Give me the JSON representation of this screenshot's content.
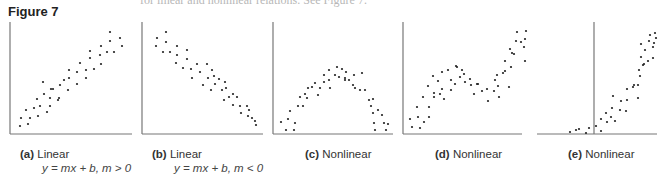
{
  "header": {
    "figure_label": "Figure 7",
    "cut_text": "for linear and nonlinear relations. See Figure 7."
  },
  "panels": [
    {
      "id": "a",
      "letter": "(a)",
      "title": "Linear",
      "equation": "y = mx + b, m > 0"
    },
    {
      "id": "b",
      "letter": "(b)",
      "title": "Linear",
      "equation": "y = mx + b, m < 0"
    },
    {
      "id": "c",
      "letter": "(c)",
      "title": "Nonlinear",
      "equation": ""
    },
    {
      "id": "d",
      "letter": "(d)",
      "title": "Nonlinear",
      "equation": ""
    },
    {
      "id": "e",
      "letter": "(e)",
      "title": "Nonlinear",
      "equation": ""
    }
  ],
  "colors": {
    "axis": "#777777",
    "point": "#222222",
    "text": "#333333"
  },
  "chart_data": [
    {
      "type": "scatter",
      "title": "(a) Linear  y = mx + b, m > 0",
      "xlabel": "",
      "ylabel": "",
      "axes_box": {
        "x0": 10,
        "x1": 132,
        "y_top": 22,
        "y_bottom": 134
      },
      "points": [
        [
          20,
          126
        ],
        [
          28,
          124
        ],
        [
          21,
          118
        ],
        [
          30,
          118
        ],
        [
          38,
          116
        ],
        [
          26,
          110
        ],
        [
          34,
          108
        ],
        [
          40,
          106
        ],
        [
          47,
          112
        ],
        [
          37,
          99
        ],
        [
          50,
          106
        ],
        [
          44,
          94
        ],
        [
          50,
          98
        ],
        [
          58,
          100
        ],
        [
          53,
          89
        ],
        [
          59,
          98
        ],
        [
          43,
          82
        ],
        [
          51,
          89
        ],
        [
          60,
          85
        ],
        [
          68,
          90
        ],
        [
          64,
          80
        ],
        [
          69,
          78
        ],
        [
          77,
          84
        ],
        [
          69,
          70
        ],
        [
          77,
          72
        ],
        [
          86,
          78
        ],
        [
          80,
          63
        ],
        [
          86,
          70
        ],
        [
          94,
          69
        ],
        [
          101,
          64
        ],
        [
          90,
          51
        ],
        [
          90,
          58
        ],
        [
          100,
          55
        ],
        [
          101,
          46
        ],
        [
          107,
          52
        ],
        [
          114,
          52
        ],
        [
          110,
          32
        ],
        [
          110,
          41
        ],
        [
          120,
          38
        ],
        [
          122,
          46
        ]
      ]
    },
    {
      "type": "scatter",
      "title": "(b) Linear  y = mx + b, m < 0",
      "xlabel": "",
      "ylabel": "",
      "axes_box": {
        "x0": 142,
        "x1": 263,
        "y_top": 22,
        "y_bottom": 134
      },
      "points": [
        [
          157,
          38
        ],
        [
          166,
          32
        ],
        [
          156,
          46
        ],
        [
          166,
          42
        ],
        [
          163,
          52
        ],
        [
          170,
          52
        ],
        [
          177,
          46
        ],
        [
          177,
          55
        ],
        [
          176,
          63
        ],
        [
          183,
          68
        ],
        [
          187,
          50
        ],
        [
          187,
          59
        ],
        [
          191,
          69
        ],
        [
          197,
          64
        ],
        [
          192,
          78
        ],
        [
          200,
          72
        ],
        [
          207,
          64
        ],
        [
          203,
          85
        ],
        [
          208,
          78
        ],
        [
          212,
          70
        ],
        [
          214,
          76
        ],
        [
          211,
          90
        ],
        [
          215,
          84
        ],
        [
          219,
          79
        ],
        [
          222,
          90
        ],
        [
          225,
          82
        ],
        [
          224,
          100
        ],
        [
          226,
          88
        ],
        [
          229,
          97
        ],
        [
          233,
          94
        ],
        [
          233,
          105
        ],
        [
          237,
          97
        ],
        [
          240,
          106
        ],
        [
          241,
          113
        ],
        [
          247,
          106
        ],
        [
          248,
          116
        ],
        [
          249,
          110
        ],
        [
          252,
          118
        ],
        [
          255,
          121
        ],
        [
          256,
          125
        ]
      ]
    },
    {
      "type": "scatter",
      "title": "(c) Nonlinear",
      "xlabel": "",
      "ylabel": "",
      "axes_box": {
        "x0": 273,
        "x1": 393,
        "y_top": 22,
        "y_bottom": 134
      },
      "points": [
        [
          281,
          122
        ],
        [
          286,
          130
        ],
        [
          294,
          130
        ],
        [
          288,
          119
        ],
        [
          290,
          111
        ],
        [
          295,
          123
        ],
        [
          298,
          106
        ],
        [
          300,
          97
        ],
        [
          305,
          94
        ],
        [
          303,
          106
        ],
        [
          307,
          98
        ],
        [
          308,
          88
        ],
        [
          312,
          87
        ],
        [
          315,
          83
        ],
        [
          318,
          95
        ],
        [
          320,
          88
        ],
        [
          324,
          82
        ],
        [
          324,
          75
        ],
        [
          329,
          70
        ],
        [
          329,
          80
        ],
        [
          330,
          88
        ],
        [
          335,
          75
        ],
        [
          339,
          77
        ],
        [
          337,
          67
        ],
        [
          342,
          69
        ],
        [
          345,
          78
        ],
        [
          345,
          80
        ],
        [
          346,
          72
        ],
        [
          349,
          80
        ],
        [
          353,
          85
        ],
        [
          354,
          75
        ],
        [
          355,
          88
        ],
        [
          362,
          73
        ],
        [
          360,
          90
        ],
        [
          365,
          90
        ],
        [
          369,
          100
        ],
        [
          373,
          99
        ],
        [
          371,
          106
        ],
        [
          373,
          113
        ],
        [
          378,
          110
        ],
        [
          374,
          123
        ],
        [
          382,
          115
        ],
        [
          384,
          123
        ],
        [
          388,
          124
        ],
        [
          386,
          130
        ],
        [
          375,
          130
        ]
      ]
    },
    {
      "type": "scatter",
      "title": "(d) Nonlinear",
      "xlabel": "",
      "ylabel": "",
      "axes_box": {
        "x0": 403,
        "x1": 522,
        "y_top": 22,
        "y_bottom": 134
      },
      "points": [
        [
          410,
          119
        ],
        [
          412,
          127
        ],
        [
          417,
          107
        ],
        [
          418,
          117
        ],
        [
          420,
          128
        ],
        [
          423,
          97
        ],
        [
          424,
          122
        ],
        [
          428,
          86
        ],
        [
          429,
          107
        ],
        [
          429,
          117
        ],
        [
          433,
          76
        ],
        [
          434,
          93
        ],
        [
          434,
          97
        ],
        [
          438,
          81
        ],
        [
          440,
          94
        ],
        [
          442,
          72
        ],
        [
          442,
          89
        ],
        [
          444,
          99
        ],
        [
          448,
          70
        ],
        [
          451,
          80
        ],
        [
          451,
          90
        ],
        [
          455,
          84
        ],
        [
          456,
          66
        ],
        [
          457,
          67
        ],
        [
          460,
          77
        ],
        [
          462,
          70
        ],
        [
          465,
          82
        ],
        [
          464,
          74
        ],
        [
          470,
          79
        ],
        [
          471,
          85
        ],
        [
          474,
          94
        ],
        [
          478,
          84
        ],
        [
          477,
          84
        ],
        [
          482,
          91
        ],
        [
          487,
          89
        ],
        [
          488,
          101
        ],
        [
          494,
          91
        ],
        [
          495,
          80
        ],
        [
          497,
          75
        ],
        [
          499,
          97
        ],
        [
          498,
          86
        ],
        [
          503,
          73
        ],
        [
          505,
          71
        ],
        [
          505,
          61
        ],
        [
          509,
          87
        ],
        [
          511,
          67
        ],
        [
          512,
          53
        ],
        [
          510,
          49
        ],
        [
          514,
          54
        ],
        [
          516,
          41
        ],
        [
          517,
          32
        ],
        [
          521,
          42
        ],
        [
          525,
          61
        ],
        [
          524,
          47
        ],
        [
          525,
          39
        ],
        [
          526,
          31
        ]
      ]
    },
    {
      "type": "scatter",
      "title": "(e) Nonlinear",
      "xlabel": "",
      "ylabel": "",
      "axes_box": {
        "x0": 537,
        "x1": 657,
        "y_top": 22,
        "y_bottom": 134,
        "y_axis_x": 594
      },
      "points": [
        [
          570,
          132
        ],
        [
          576,
          130
        ],
        [
          579,
          129
        ],
        [
          586,
          133
        ],
        [
          589,
          128
        ],
        [
          596,
          126
        ],
        [
          601,
          131
        ],
        [
          601,
          119
        ],
        [
          606,
          113
        ],
        [
          607,
          122
        ],
        [
          611,
          117
        ],
        [
          612,
          108
        ],
        [
          613,
          96
        ],
        [
          615,
          121
        ],
        [
          620,
          110
        ],
        [
          621,
          101
        ],
        [
          627,
          100
        ],
        [
          627,
          89
        ],
        [
          626,
          111
        ],
        [
          634,
          85
        ],
        [
          638,
          98
        ],
        [
          633,
          87
        ],
        [
          638,
          85
        ],
        [
          640,
          76
        ],
        [
          639,
          70
        ],
        [
          644,
          64
        ],
        [
          641,
          57
        ],
        [
          643,
          65
        ],
        [
          645,
          50
        ],
        [
          648,
          61
        ],
        [
          649,
          41
        ],
        [
          641,
          44
        ],
        [
          650,
          35
        ],
        [
          653,
          47
        ],
        [
          653,
          58
        ],
        [
          654,
          43
        ],
        [
          655,
          33
        ],
        [
          656,
          38
        ]
      ]
    }
  ]
}
